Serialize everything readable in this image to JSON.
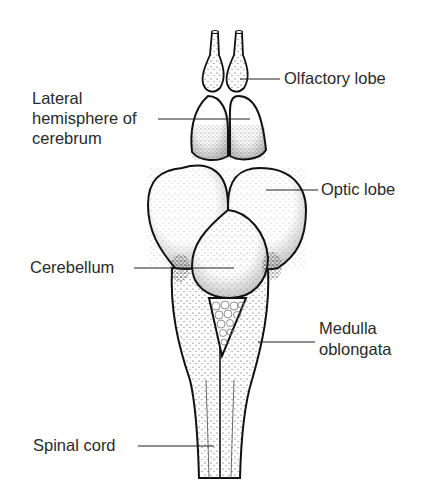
{
  "diagram": {
    "labels": {
      "olfactory_lobe": "Olfactory lobe",
      "lateral_hemisphere_line1": "Lateral",
      "lateral_hemisphere_line2": "hemisphere of",
      "lateral_hemisphere_line3": "cerebrum",
      "optic_lobe": "Optic lobe",
      "cerebellum": "Cerebellum",
      "medulla_line1": "Medulla",
      "medulla_line2": "oblongata",
      "spinal_cord": "Spinal cord"
    },
    "colors": {
      "ink": "#111111",
      "text": "#2a2a2a",
      "background": "#ffffff"
    }
  }
}
